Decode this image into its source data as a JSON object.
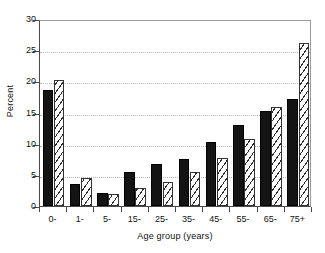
{
  "chart_data": {
    "type": "bar",
    "title": "",
    "subtitle": "",
    "xlabel": "Age group (years)",
    "ylabel": "Percent",
    "categories": [
      "0-",
      "1-",
      "5-",
      "15-",
      "25-",
      "35-",
      "45-",
      "55-",
      "65-",
      "75+"
    ],
    "series": [
      {
        "name": "solid",
        "fill": "solid-black",
        "values": [
          18.6,
          3.6,
          2.1,
          5.4,
          6.7,
          7.5,
          10.3,
          13.0,
          15.3,
          17.1
        ]
      },
      {
        "name": "hatched",
        "fill": "diagonal-hatch",
        "values": [
          20.2,
          4.5,
          1.9,
          2.9,
          3.9,
          5.4,
          7.7,
          10.8,
          15.9,
          26.2
        ]
      }
    ],
    "ylim": [
      0,
      30
    ],
    "yticks": [
      0,
      5,
      10,
      15,
      20,
      25,
      30
    ],
    "ytick_labels": [
      "0",
      "5",
      "10",
      "15",
      "20",
      "25",
      "30"
    ],
    "xlim_categories": 10,
    "grid": {
      "horizontal": true,
      "style": "dotted",
      "vertical": false
    },
    "legend": {
      "visible": false,
      "position": "none"
    },
    "annotations": [],
    "colors": {
      "series_solid": "#141414",
      "series_hatch_line": "#2a2a2a",
      "series_hatch_bg": "#ffffff",
      "axis": "#4a4a4a",
      "grid": "#b5b5b5",
      "background": "#ffffff",
      "text": "#111111"
    }
  }
}
